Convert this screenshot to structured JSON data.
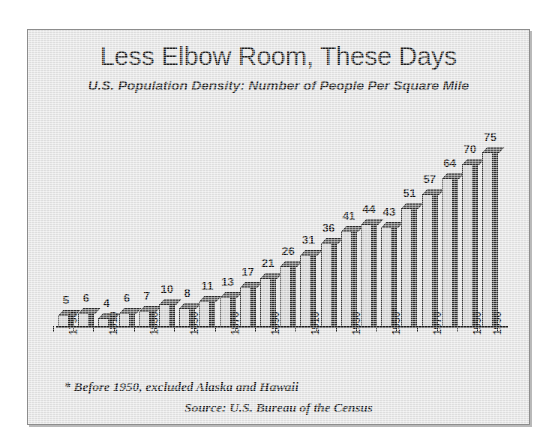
{
  "chart_data": {
    "type": "bar",
    "title": "Less Elbow Room, These Days",
    "subtitle": "U.S. Population Density:  Number of People Per Square Mile",
    "xlabel": "",
    "ylabel": "",
    "ylim": [
      0,
      80
    ],
    "grid": false,
    "legend": "none",
    "categories": [
      "1790",
      "1800",
      "1810",
      "1820",
      "1830",
      "1840",
      "1850",
      "1860",
      "1870",
      "1880",
      "1890",
      "1900",
      "1910",
      "1920",
      "1930",
      "1940",
      "1950*",
      "1960",
      "1970",
      "1980",
      "1990",
      "1996"
    ],
    "values": [
      5,
      6,
      4,
      6,
      7,
      10,
      8,
      11,
      13,
      17,
      21,
      26,
      31,
      36,
      41,
      44,
      43,
      51,
      57,
      64,
      70,
      75
    ],
    "tick_labels": [
      "1790",
      "1810",
      "1830",
      "1850",
      "1870",
      "1890",
      "1910",
      "1930",
      "1950*",
      "1970",
      "1990",
      "1996"
    ],
    "tick_label_indices": [
      0,
      2,
      4,
      6,
      8,
      10,
      12,
      14,
      16,
      18,
      20,
      21
    ],
    "annotations": [
      "* Before 1950, excluded Alaska and Hawaii",
      "Source: U.S. Bureau of the Census"
    ]
  },
  "footnotes": {
    "asterisk_note": "* Before 1950, excluded Alaska and Hawaii",
    "source": "Source: U.S. Bureau of the Census"
  }
}
